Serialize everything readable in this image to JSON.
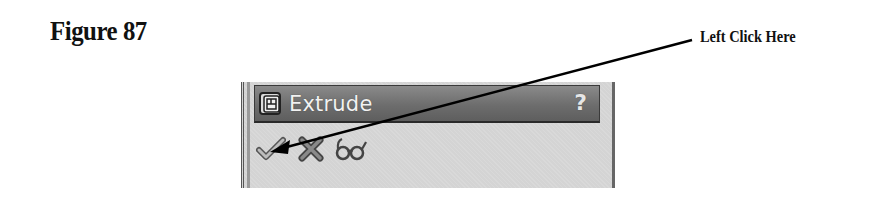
{
  "figure": {
    "label": "Figure 87"
  },
  "callout": {
    "text": "Left Click Here",
    "target": "ok-checkmark-button"
  },
  "panel": {
    "title": "Extrude",
    "title_icon": "extrude-feature-icon",
    "help_label": "?",
    "toolbar": [
      {
        "name": "ok",
        "icon": "checkmark-icon",
        "tooltip": "OK"
      },
      {
        "name": "cancel",
        "icon": "x-icon",
        "tooltip": "Cancel"
      },
      {
        "name": "preview",
        "icon": "eyeglasses-icon",
        "tooltip": "Detailed Preview"
      }
    ]
  },
  "colors": {
    "title_bar": "#6d6d6d",
    "panel_bg": "#d4d4d4",
    "text_dark": "#111111",
    "title_text": "#f2f2f2"
  }
}
